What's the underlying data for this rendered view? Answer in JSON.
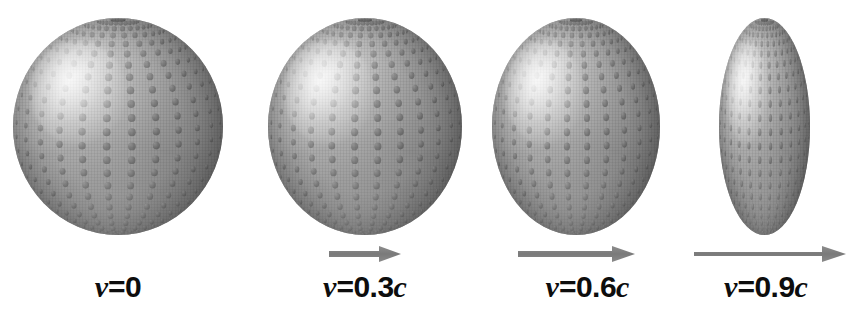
{
  "figure": {
    "name": "relativistic-length-contraction-sphere-series",
    "background_color": "#ffffff",
    "body_color_light": "#e4e4e4",
    "body_color_mid": "#8d8d8d",
    "body_color_dark": "#707070",
    "dot_color": "#5f5f5f",
    "arrow_color": "#7d7d7d",
    "label_color": "#0d0d0d"
  },
  "panels": [
    {
      "id": "panel-v0",
      "speed_symbol": "v",
      "equals_value": "=0",
      "c_symbol": "",
      "label_full": "v=0",
      "has_arrow": false,
      "arrow_length_px": 0,
      "body": {
        "left": 13,
        "top": 18,
        "width": 210,
        "height": 217
      },
      "contraction_factor": 1.0
    },
    {
      "id": "panel-v03c",
      "speed_symbol": "v",
      "equals_value": "=0.3",
      "c_symbol": "c",
      "label_full": "v=0.3c",
      "has_arrow": true,
      "arrow_length_px": 72,
      "body": {
        "left": 268,
        "top": 18,
        "width": 194,
        "height": 217
      },
      "contraction_factor": 0.954
    },
    {
      "id": "panel-v06c",
      "speed_symbol": "v",
      "equals_value": "=0.6",
      "c_symbol": "c",
      "label_full": "v=0.6c",
      "has_arrow": true,
      "arrow_length_px": 117,
      "body": {
        "left": 492,
        "top": 18,
        "width": 168,
        "height": 217
      },
      "contraction_factor": 0.8
    },
    {
      "id": "panel-v09c",
      "speed_symbol": "v",
      "equals_value": "=0.9",
      "c_symbol": "c",
      "label_full": "v=0.9c",
      "has_arrow": true,
      "arrow_length_px": 152,
      "body": {
        "left": 719,
        "top": 18,
        "width": 91,
        "height": 217
      },
      "contraction_factor": 0.436
    }
  ],
  "chart_data": {
    "type": "diagram",
    "title": "",
    "categories": [
      "v=0",
      "v=0.3c",
      "v=0.6c",
      "v=0.9c"
    ],
    "series": [
      {
        "name": "horizontal width (px)",
        "values": [
          210,
          194,
          168,
          91
        ]
      },
      {
        "name": "vertical height (px)",
        "values": [
          217,
          217,
          217,
          217
        ]
      },
      {
        "name": "contraction factor 1/gamma",
        "values": [
          1.0,
          0.954,
          0.8,
          0.436
        ]
      },
      {
        "name": "velocity fraction of c",
        "values": [
          0,
          0.3,
          0.6,
          0.9
        ]
      },
      {
        "name": "arrow length (px)",
        "values": [
          0,
          72,
          117,
          152
        ]
      }
    ]
  }
}
